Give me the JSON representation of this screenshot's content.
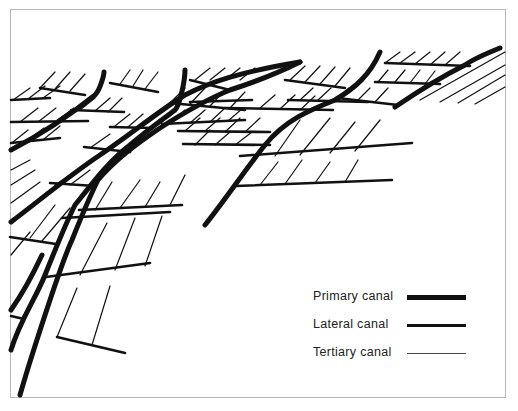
{
  "figure": {
    "background": "#ffffff",
    "frame_color": "#b8b8b8",
    "line_color": "#111111"
  },
  "legend": {
    "items": [
      {
        "label": "Primary canal",
        "stroke_width": 5
      },
      {
        "label": "Lateral canal",
        "stroke_width": 3
      },
      {
        "label": "Tertiary canal",
        "stroke_width": 1.3
      }
    ]
  }
}
